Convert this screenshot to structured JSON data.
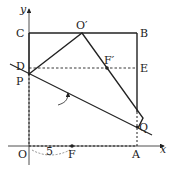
{
  "diagram": {
    "type": "coordinate-geometry-folding",
    "axes": {
      "x_label": "x",
      "y_label": "y",
      "origin_label": "O"
    },
    "points": [
      {
        "id": "O",
        "label": "O",
        "x": 29,
        "y": 146
      },
      {
        "id": "C",
        "label": "C",
        "x": 29,
        "y": 33
      },
      {
        "id": "B",
        "label": "B",
        "x": 137,
        "y": 33
      },
      {
        "id": "Oprime",
        "label": "O′",
        "x": 82,
        "y": 33
      },
      {
        "id": "D",
        "label": "D",
        "x": 29,
        "y": 68
      },
      {
        "id": "E",
        "label": "E",
        "x": 137,
        "y": 68
      },
      {
        "id": "P",
        "label": "P",
        "x": 29,
        "y": 74
      },
      {
        "id": "Fprime",
        "label": "F′",
        "x": 107,
        "y": 68
      },
      {
        "id": "F",
        "label": "F",
        "x": 72,
        "y": 146
      },
      {
        "id": "A",
        "label": "A",
        "x": 137,
        "y": 146
      },
      {
        "id": "Q",
        "label": "Q",
        "x": 137,
        "y": 127
      }
    ],
    "measure": {
      "label": "5",
      "from": "O",
      "to": "F"
    },
    "colors": {
      "stroke": "#222222",
      "background": "#ffffff"
    }
  }
}
